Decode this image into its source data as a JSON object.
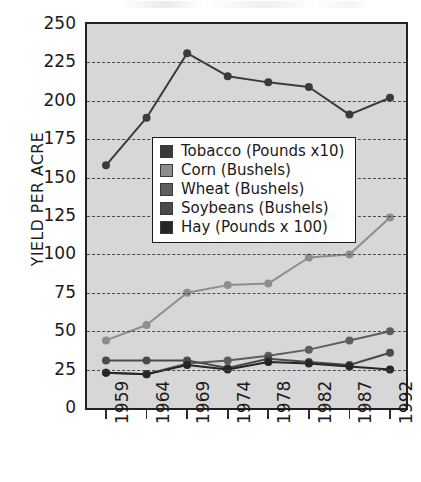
{
  "chart_data": {
    "type": "line",
    "title": "",
    "xlabel": "",
    "ylabel": "YIELD PER ACRE",
    "x": [
      "1959",
      "1964",
      "1969",
      "1974",
      "1978",
      "1982",
      "1987",
      "1992"
    ],
    "categories": [
      "1959",
      "1964",
      "1969",
      "1974",
      "1978",
      "1982",
      "1987",
      "1992"
    ],
    "ylim": [
      0,
      250
    ],
    "ytick_labels": [
      "0",
      "25",
      "50",
      "75",
      "100",
      "125",
      "150",
      "175",
      "200",
      "225",
      "250"
    ],
    "ytick_values": [
      0,
      25,
      50,
      75,
      100,
      125,
      150,
      175,
      200,
      225,
      250
    ],
    "grid": "horizontal-dashed",
    "legend_position": "center-left-inside",
    "plot_background": "#d7d7d7",
    "series": [
      {
        "name": "Tobacco (Pounds x10)",
        "color": "#3a3a3a",
        "values": [
          158,
          189,
          231,
          216,
          212,
          209,
          191,
          202
        ]
      },
      {
        "name": "Corn (Bushels)",
        "color": "#8d8d8d",
        "values": [
          44,
          54,
          75,
          80,
          81,
          98,
          100,
          124
        ]
      },
      {
        "name": "Wheat (Bushels)",
        "color": "#5e5e5e",
        "values": [
          23,
          22,
          29,
          31,
          34,
          38,
          44,
          50
        ]
      },
      {
        "name": "Soybeans (Bushels)",
        "color": "#4a4a4a",
        "values": [
          31,
          31,
          31,
          26,
          32,
          30,
          28,
          36
        ]
      },
      {
        "name": "Hay (Pounds x 100)",
        "color": "#262626",
        "values": [
          23,
          22,
          28,
          25,
          30,
          29,
          27,
          25
        ]
      }
    ]
  },
  "legend": {
    "items": [
      {
        "label": "Tobacco (Pounds x10)",
        "color": "#3a3a3a"
      },
      {
        "label": "Corn (Bushels)",
        "color": "#8d8d8d"
      },
      {
        "label": "Wheat (Bushels)",
        "color": "#5e5e5e"
      },
      {
        "label": "Soybeans (Bushels)",
        "color": "#4a4a4a"
      },
      {
        "label": "Hay (Pounds x 100)",
        "color": "#262626"
      }
    ]
  }
}
